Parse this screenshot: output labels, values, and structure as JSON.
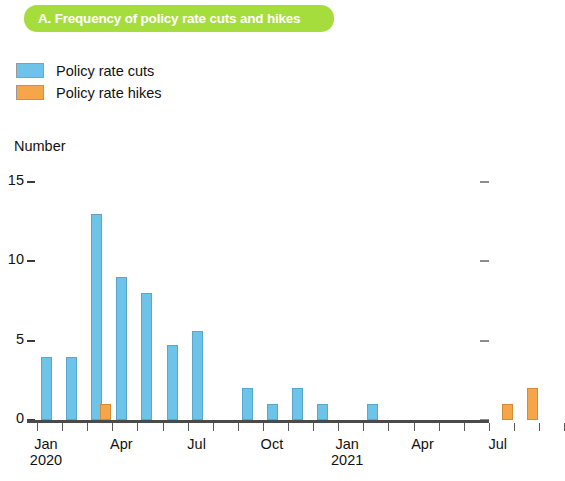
{
  "title": {
    "text": "A. Frequency of policy rate cuts and hikes",
    "banner_color": "#a5dd3c",
    "text_color": "#ffffff"
  },
  "legend": {
    "items": [
      {
        "label": "Policy rate cuts",
        "color": "#6ec4e8",
        "key": "cuts"
      },
      {
        "label": "Policy rate hikes",
        "color": "#f5a64b",
        "key": "hikes"
      }
    ]
  },
  "axes": {
    "y_title": "Number",
    "y_ticks": [
      "0",
      "5",
      "10",
      "15"
    ],
    "x_labels": [
      {
        "month": "Jan",
        "year": "2020"
      },
      {
        "month": "Apr",
        "year": ""
      },
      {
        "month": "Jul",
        "year": ""
      },
      {
        "month": "Oct",
        "year": ""
      },
      {
        "month": "Jan",
        "year": "2021"
      },
      {
        "month": "Apr",
        "year": ""
      },
      {
        "month": "Jul",
        "year": ""
      }
    ]
  },
  "chart_data": {
    "type": "bar",
    "title": "A. Frequency of policy rate cuts and hikes",
    "xlabel": "",
    "ylabel": "Number",
    "ylim": [
      0,
      15
    ],
    "yticks": [
      0,
      5,
      10,
      15
    ],
    "grid": false,
    "legend_position": "top-left",
    "categories": [
      "Jan 2020",
      "Feb 2020",
      "Mar 2020",
      "Apr 2020",
      "May 2020",
      "Jun 2020",
      "Jul 2020",
      "Aug 2020",
      "Sep 2020",
      "Oct 2020",
      "Nov 2020",
      "Dec 2020",
      "Jan 2021",
      "Feb 2021",
      "Mar 2021",
      "Apr 2021",
      "May 2021",
      "Jun 2021",
      "Jul 2021",
      "Aug 2021",
      "Sep 2021"
    ],
    "series": [
      {
        "name": "Policy rate cuts",
        "color": "#6ec4e8",
        "values": [
          4,
          4,
          13,
          9,
          8,
          4.7,
          5.6,
          0,
          2,
          1,
          2,
          1,
          0,
          1,
          0,
          0,
          0,
          0,
          0,
          0,
          0
        ]
      },
      {
        "name": "Policy rate hikes",
        "color": "#f5a64b",
        "values": [
          0,
          0,
          1,
          0,
          0,
          0,
          0,
          0,
          0,
          0,
          0,
          0,
          0,
          0,
          0,
          0,
          0,
          0,
          1,
          2,
          0
        ]
      }
    ],
    "x_tick_labels": [
      "Jan 2020",
      "Apr",
      "Jul",
      "Oct",
      "Jan 2021",
      "Apr",
      "Jul"
    ]
  }
}
